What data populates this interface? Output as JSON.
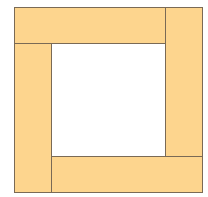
{
  "diagram": {
    "fill_color": "#fdd58e",
    "stroke_color": "#7a6a55",
    "hole_color": "#ffffff",
    "pieces": [
      {
        "name": "top-rectangle",
        "x": 14,
        "y": 7,
        "w": 152,
        "h": 37
      },
      {
        "name": "right-rectangle",
        "x": 165,
        "y": 7,
        "w": 38,
        "h": 150
      },
      {
        "name": "bottom-rectangle",
        "x": 51,
        "y": 156,
        "w": 152,
        "h": 37
      },
      {
        "name": "left-rectangle",
        "x": 14,
        "y": 43,
        "w": 38,
        "h": 150
      }
    ],
    "center_square": {
      "x": 52,
      "y": 44,
      "w": 113,
      "h": 112
    }
  }
}
